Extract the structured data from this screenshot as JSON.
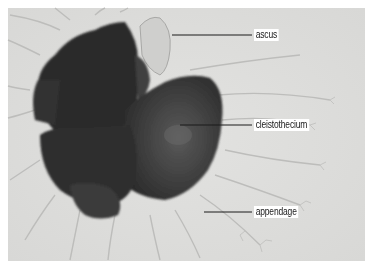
{
  "figure": {
    "labels": [
      {
        "id": "ascus",
        "text": "ascus"
      },
      {
        "id": "cleistothecium",
        "text": "cleistothecium"
      },
      {
        "id": "appendage",
        "text": "appendage"
      }
    ],
    "colors": {
      "background": "#e4e4e2",
      "mass": "#2e2e2e",
      "leader_line": "#1a1a1a"
    }
  }
}
